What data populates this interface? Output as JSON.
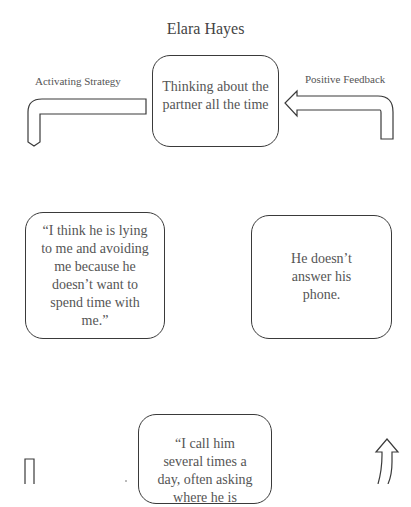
{
  "title": "Elara Hayes",
  "labels": {
    "left": "Activating Strategy",
    "right": "Positive Feedback"
  },
  "nodes": {
    "top": "Thinking about the partner all the time",
    "left": "“I think he is lying to me and avoiding me because he doesn’t want to spend time with me.”",
    "right": "He doesn’t answer his phone.",
    "bottom": "“I call him several times a day, often asking where he is"
  },
  "arrows": [
    {
      "name": "activating-strategy-arrow",
      "direction": "down"
    },
    {
      "name": "positive-feedback-arrow",
      "direction": "left"
    },
    {
      "name": "bottom-left-arrow",
      "direction": "down"
    },
    {
      "name": "bottom-right-arrow",
      "direction": "up"
    }
  ]
}
